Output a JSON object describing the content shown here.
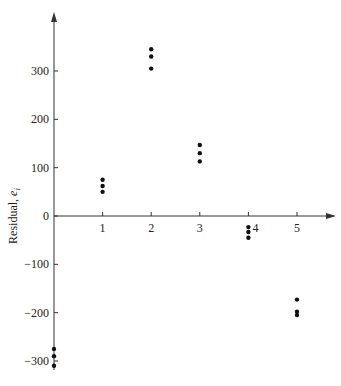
{
  "chart_data": {
    "type": "scatter",
    "title": "",
    "xlabel": "",
    "ylabel": "Residual, e_i",
    "ylabel_main": "Residual, ",
    "ylabel_var": "e",
    "ylabel_sub": "i",
    "x_ticks": [
      1,
      2,
      3,
      4,
      5
    ],
    "y_ticks": [
      -300,
      -200,
      -100,
      0,
      100,
      200,
      300
    ],
    "xlim": [
      0,
      5.5
    ],
    "ylim": [
      -340,
      420
    ],
    "grid": false,
    "legend": null,
    "series": [
      {
        "name": "residuals",
        "points": [
          {
            "x": 0,
            "y": -275
          },
          {
            "x": 0,
            "y": -290
          },
          {
            "x": 0,
            "y": -310
          },
          {
            "x": 1,
            "y": 75
          },
          {
            "x": 1,
            "y": 62
          },
          {
            "x": 1,
            "y": 50
          },
          {
            "x": 2,
            "y": 345
          },
          {
            "x": 2,
            "y": 330
          },
          {
            "x": 2,
            "y": 305
          },
          {
            "x": 3,
            "y": 147
          },
          {
            "x": 3,
            "y": 130
          },
          {
            "x": 3,
            "y": 113
          },
          {
            "x": 4,
            "y": -23
          },
          {
            "x": 4,
            "y": -33
          },
          {
            "x": 4,
            "y": -45
          },
          {
            "x": 5,
            "y": -173
          },
          {
            "x": 5,
            "y": -198
          },
          {
            "x": 5,
            "y": -205
          }
        ]
      }
    ]
  },
  "colors": {
    "axis": "#333333",
    "points": "#111111",
    "background": "#ffffff"
  }
}
